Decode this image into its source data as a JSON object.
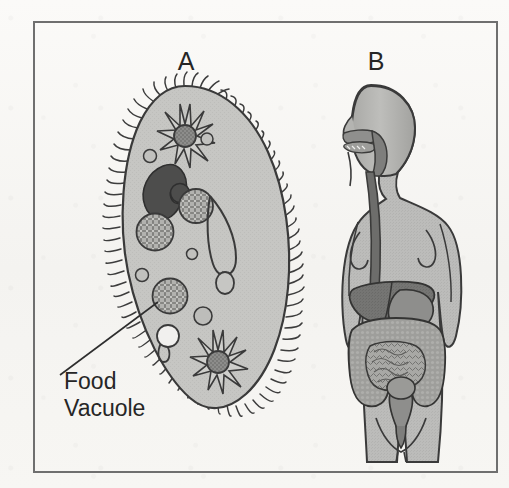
{
  "figure": {
    "background_color": "#f7f6f4",
    "frame": {
      "name": "figure-border",
      "x": 34,
      "y": 22,
      "width": 463,
      "height": 450,
      "stroke_color": "#6f6f6f",
      "stroke_width": 2
    },
    "panels": [
      {
        "id": "A",
        "label": "A",
        "label_x": 186,
        "label_y": 68,
        "subject": "paramecium",
        "description": "Paramecium single-celled organism with cilia",
        "parts": [
          {
            "name": "cilia",
            "color": "#3a3a3a"
          },
          {
            "name": "cell-membrane",
            "color": "#3a3a3a"
          },
          {
            "name": "cytoplasm",
            "color": "#c3c3c1"
          },
          {
            "name": "contractile-vacuole-anterior",
            "color": "#8a8a88"
          },
          {
            "name": "contractile-vacuole-posterior",
            "color": "#8a8a88"
          },
          {
            "name": "macronucleus",
            "color": "#4a4a4a"
          },
          {
            "name": "micronucleus",
            "color": "#4a4a4a"
          },
          {
            "name": "food-vacuole",
            "color": "#a9a9a6"
          },
          {
            "name": "oral-groove",
            "color": "#3a3a3a"
          },
          {
            "name": "gullet",
            "color": "#3a3a3a"
          }
        ]
      },
      {
        "id": "B",
        "label": "B",
        "label_x": 376,
        "label_y": 68,
        "subject": "human-digestive-system",
        "description": "Human female torso showing the digestive tract",
        "parts": [
          {
            "name": "body-outline",
            "color": "#b9b9b7"
          },
          {
            "name": "mouth-oral-cavity",
            "color": "#8d8d8b"
          },
          {
            "name": "pharynx",
            "color": "#7c7c7a"
          },
          {
            "name": "esophagus",
            "color": "#6a6a68"
          },
          {
            "name": "stomach",
            "color": "#8a8a88"
          },
          {
            "name": "liver",
            "color": "#717170"
          },
          {
            "name": "large-intestine",
            "color": "#999997"
          },
          {
            "name": "small-intestine",
            "color": "#a6a6a3"
          },
          {
            "name": "rectum",
            "color": "#8a8a88"
          },
          {
            "name": "anus",
            "color": "#7a7a78"
          }
        ]
      }
    ],
    "annotations": [
      {
        "name": "food-vacuole-callout",
        "text_line_1": "Food",
        "text_line_2": "Vacuole",
        "text_x": 64,
        "text_line_1_y": 389,
        "text_line_2_y": 416,
        "font_size": 23,
        "text_color": "#262626",
        "leader_line": {
          "from_x": 60,
          "from_y": 375,
          "to_x": 155,
          "to_y": 300,
          "stroke_color": "#2e2e2e",
          "stroke_width": 1.6
        }
      }
    ]
  }
}
